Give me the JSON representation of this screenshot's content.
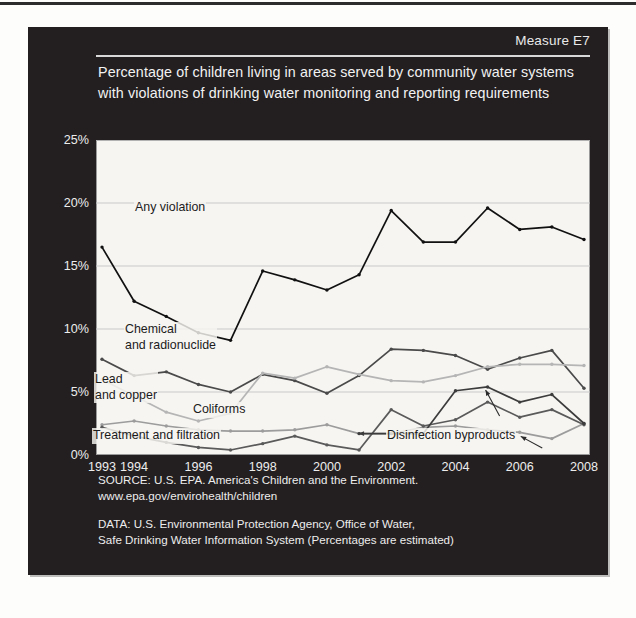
{
  "header": {
    "measure_label": "Measure E7",
    "title": "Percentage of children living in areas served by community water systems with violations of drinking water monitoring and reporting requirements"
  },
  "footer": {
    "source_line1": "SOURCE: U.S. EPA. America's Children and the Environment.",
    "source_line2": "www.epa.gov/envirohealth/children",
    "data_line1": "DATA: U.S. Environmental Protection Agency, Office of Water,",
    "data_line2": "Safe Drinking Water Information System (Percentages are estimated)"
  },
  "annotations": {
    "any_violation": "Any violation",
    "chemical_line1": "Chemical",
    "chemical_line2": "and radionuclide",
    "lead_line1": "Lead",
    "lead_line2": "and copper",
    "coliforms": "Coliforms",
    "treatment": "Treatment and filtration",
    "disinfection": "Disinfection byproducts"
  },
  "chart_data": {
    "type": "line",
    "title": "Percentage of children living in areas served by community water systems with violations of drinking water monitoring and reporting requirements",
    "xlabel": "",
    "ylabel": "",
    "ylim": [
      0,
      25
    ],
    "yticks": [
      "0%",
      "5%",
      "10%",
      "15%",
      "20%",
      "25%"
    ],
    "ytick_values": [
      0,
      5,
      10,
      15,
      20,
      25
    ],
    "grid": true,
    "legend_position": "inline-annotations",
    "x": [
      1993,
      1994,
      1995,
      1996,
      1997,
      1998,
      1999,
      2000,
      2001,
      2002,
      2003,
      2004,
      2005,
      2006,
      2007,
      2008
    ],
    "xtick_labels": [
      "1993",
      "1994",
      "1996",
      "1998",
      "2000",
      "2002",
      "2004",
      "2006",
      "2008"
    ],
    "xtick_values": [
      1993,
      1994,
      1996,
      1998,
      2000,
      2002,
      2004,
      2006,
      2008
    ],
    "series": [
      {
        "name": "Any violation",
        "color": "#111111",
        "values": [
          16.5,
          12.2,
          11.0,
          9.7,
          9.1,
          14.6,
          13.9,
          13.1,
          14.3,
          19.4,
          16.9,
          16.9,
          19.6,
          17.9,
          18.1,
          17.1
        ]
      },
      {
        "name": "Chemical and radionuclide",
        "color": "#4a4a4a",
        "values": [
          7.6,
          6.3,
          6.6,
          5.6,
          5.0,
          6.4,
          5.9,
          4.9,
          6.3,
          8.4,
          8.3,
          7.9,
          6.8,
          7.7,
          8.3,
          5.3
        ]
      },
      {
        "name": "Lead and copper",
        "color": "#b5b5b5",
        "values": [
          6.0,
          4.7,
          3.4,
          2.7,
          3.3,
          6.5,
          6.1,
          7.0,
          6.4,
          5.9,
          5.8,
          6.3,
          7.0,
          7.2,
          7.2,
          7.1
        ]
      },
      {
        "name": "Coliforms",
        "color": "#9c9c9c",
        "values": [
          2.4,
          2.7,
          2.3,
          2.0,
          1.9,
          1.9,
          2.0,
          2.4,
          1.7,
          1.7,
          2.2,
          2.3,
          2.0,
          1.8,
          1.3,
          2.5
        ]
      },
      {
        "name": "Treatment and filtration",
        "color": "#5a5a5a",
        "values": [
          2.2,
          1.5,
          1.0,
          0.6,
          0.4,
          0.9,
          1.5,
          0.8,
          0.4,
          3.6,
          2.3,
          2.8,
          4.2,
          3.0,
          3.6,
          2.4
        ]
      },
      {
        "name": "Disinfection byproducts",
        "color": "#3c3c3c",
        "values": [
          null,
          null,
          null,
          null,
          null,
          null,
          null,
          null,
          1.7,
          1.7,
          1.7,
          5.1,
          5.4,
          4.2,
          4.8,
          2.5
        ]
      }
    ]
  }
}
